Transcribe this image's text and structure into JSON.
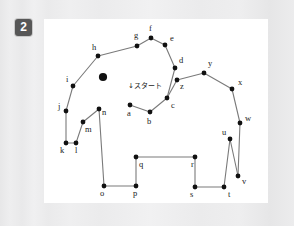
{
  "page": {
    "background_color": "#ececed",
    "panel_color": "#ffffff",
    "line_color": "#7a7a7a",
    "dot_color": "#111111",
    "badge_color": "#575757",
    "badge_text_color": "#ffffff"
  },
  "badge": {
    "label": "2",
    "name": "exercise-number-badge"
  },
  "puzzle": {
    "title": "",
    "start_label": "↓スタート",
    "start_label_x": 84,
    "start_label_y": 69,
    "eye": {
      "cx": 59,
      "cy": 58,
      "r": 4.1
    },
    "points": [
      {
        "id": "a",
        "x": 86,
        "y": 86,
        "lx": 83,
        "ly": 97
      },
      {
        "id": "b",
        "x": 106,
        "y": 93,
        "lx": 103,
        "ly": 105
      },
      {
        "id": "c",
        "x": 123,
        "y": 79,
        "lx": 127,
        "ly": 89
      },
      {
        "id": "d",
        "x": 131,
        "y": 49,
        "lx": 135,
        "ly": 44
      },
      {
        "id": "e",
        "x": 121,
        "y": 26,
        "lx": 126,
        "ly": 22
      },
      {
        "id": "f",
        "x": 107,
        "y": 19,
        "lx": 105,
        "ly": 12
      },
      {
        "id": "g",
        "x": 93,
        "y": 27,
        "lx": 90,
        "ly": 19
      },
      {
        "id": "h",
        "x": 54,
        "y": 37,
        "lx": 48,
        "ly": 31
      },
      {
        "id": "i",
        "x": 29,
        "y": 67,
        "lx": 22,
        "ly": 63
      },
      {
        "id": "j",
        "x": 22,
        "y": 92,
        "lx": 14,
        "ly": 90
      },
      {
        "id": "k",
        "x": 22,
        "y": 124,
        "lx": 16,
        "ly": 134
      },
      {
        "id": "l",
        "x": 32,
        "y": 124,
        "lx": 31,
        "ly": 134
      },
      {
        "id": "m",
        "x": 39,
        "y": 103,
        "lx": 41,
        "ly": 113
      },
      {
        "id": "n",
        "x": 55,
        "y": 90,
        "lx": 58,
        "ly": 96
      },
      {
        "id": "o",
        "x": 60,
        "y": 167,
        "lx": 56,
        "ly": 177
      },
      {
        "id": "p",
        "x": 92,
        "y": 167,
        "lx": 89,
        "ly": 177
      },
      {
        "id": "q",
        "x": 92,
        "y": 138,
        "lx": 95,
        "ly": 148
      },
      {
        "id": "r",
        "x": 151,
        "y": 138,
        "lx": 147,
        "ly": 148
      },
      {
        "id": "s",
        "x": 151,
        "y": 168,
        "lx": 146,
        "ly": 178
      },
      {
        "id": "t",
        "x": 180,
        "y": 168,
        "lx": 184,
        "ly": 178
      },
      {
        "id": "u",
        "x": 186,
        "y": 120,
        "lx": 178,
        "ly": 116
      },
      {
        "id": "v",
        "x": 194,
        "y": 157,
        "lx": 198,
        "ly": 165
      },
      {
        "id": "w",
        "x": 196,
        "y": 104,
        "lx": 201,
        "ly": 102
      },
      {
        "id": "x",
        "x": 188,
        "y": 70,
        "lx": 194,
        "ly": 66
      },
      {
        "id": "y",
        "x": 160,
        "y": 54,
        "lx": 164,
        "ly": 47
      },
      {
        "id": "z",
        "x": 133,
        "y": 61,
        "lx": 136,
        "ly": 70
      }
    ],
    "path_order": [
      "a",
      "b",
      "c",
      "d",
      "e",
      "f",
      "g",
      "h",
      "i",
      "j",
      "k",
      "l",
      "m",
      "n",
      "o",
      "p",
      "q",
      "r",
      "s",
      "t",
      "u",
      "v",
      "w",
      "x",
      "y",
      "z",
      "c"
    ]
  }
}
